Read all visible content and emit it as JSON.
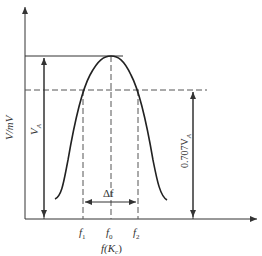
{
  "diagram": {
    "type": "resonance-curve",
    "y_axis_label": "V/mV",
    "x_axis_label": "f(Kₑ)",
    "x_axis_label_main": "f(K",
    "x_axis_label_sub": "c",
    "x_axis_label_close": ")",
    "peak_label": "V",
    "peak_label_sub": "A",
    "half_power_label": "0.707V",
    "half_power_label_sub": "A",
    "bandwidth_label": "Δf",
    "ticks": [
      {
        "main": "f",
        "sub": "1"
      },
      {
        "main": "f",
        "sub": "0"
      },
      {
        "main": "f",
        "sub": "2"
      }
    ],
    "colors": {
      "line": "#333333",
      "dashed": "#555555",
      "background": "#ffffff"
    }
  }
}
